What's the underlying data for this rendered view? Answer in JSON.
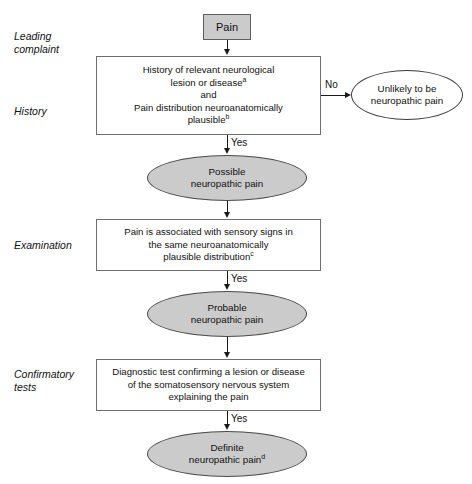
{
  "diagram": {
    "colors": {
      "fill_gray": "#cbcbcb",
      "box_border": "#6e6e6e",
      "ellipse_border": "#3a3a3a",
      "connector": "#1a1a1a",
      "background": "#ffffff",
      "text": "#111111"
    },
    "stage_labels": [
      {
        "id": "leading-complaint",
        "text": "Leading\ncomplaint"
      },
      {
        "id": "history",
        "text": "History"
      },
      {
        "id": "examination",
        "text": "Examination"
      },
      {
        "id": "confirmatory-tests",
        "text": "Confirmatory\ntests"
      }
    ],
    "nodes": [
      {
        "id": "pain",
        "shape": "rect",
        "fill": "gray",
        "text": "Pain"
      },
      {
        "id": "history-criteria",
        "shape": "rect",
        "fill": "white",
        "line1": "History of relevant neurological",
        "line2": "lesion or disease",
        "line2_sup": "a",
        "line3": "and",
        "line4": "Pain distribution neuroanatomically",
        "line5": "plausible",
        "line5_sup": "b"
      },
      {
        "id": "unlikely-neuropathic-pain",
        "shape": "ellipse",
        "fill": "white",
        "text": "Unlikely to be\nneuropathic pain"
      },
      {
        "id": "possible-neuropathic-pain",
        "shape": "ellipse",
        "fill": "gray",
        "text": "Possible\nneuropathic pain"
      },
      {
        "id": "examination-criteria",
        "shape": "rect",
        "fill": "white",
        "line1": "Pain is associated with sensory signs in",
        "line2": "the same neuroanatomically",
        "line3": "plausible distribution",
        "line3_sup": "c"
      },
      {
        "id": "probable-neuropathic-pain",
        "shape": "ellipse",
        "fill": "gray",
        "text": "Probable\nneuropathic pain"
      },
      {
        "id": "confirmatory-criteria",
        "shape": "rect",
        "fill": "white",
        "line1": "Diagnostic test confirming a lesion or disease",
        "line2": "of the somatosensory nervous system",
        "line3": "explaining the pain"
      },
      {
        "id": "definite-neuropathic-pain",
        "shape": "ellipse",
        "fill": "gray",
        "line1": "Definite",
        "line2": "neuropathic pain",
        "line2_sup": "d"
      }
    ],
    "edge_labels": {
      "history_no": "No",
      "history_yes": "Yes",
      "examination_yes": "Yes",
      "confirmatory_yes": "Yes"
    }
  }
}
